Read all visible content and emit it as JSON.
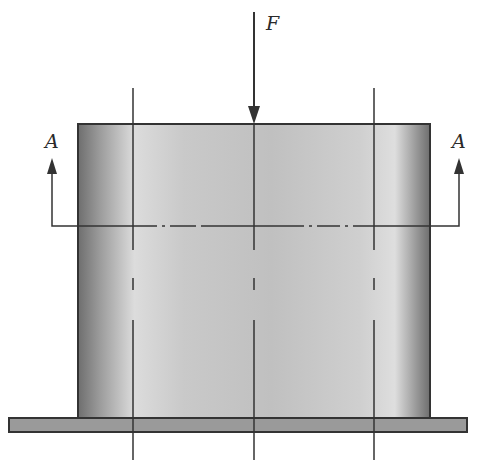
{
  "diagram": {
    "type": "engineering-section-view",
    "labels": {
      "force": "F",
      "section_left": "A",
      "section_right": "A"
    },
    "colors": {
      "line": "#333333",
      "cylinder_edge": "#7a7a7a",
      "cylinder_mid": "#c4c4c4",
      "base_plate": "#9a9a9a"
    }
  }
}
